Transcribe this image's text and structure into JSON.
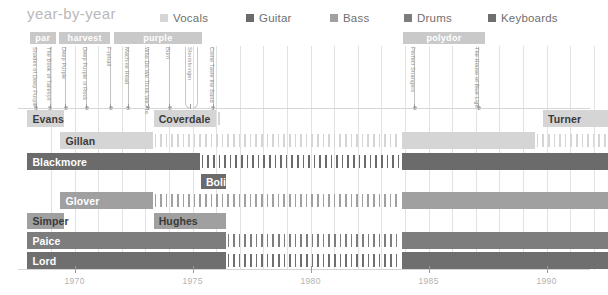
{
  "header": {
    "title": "year-by-year",
    "legend": [
      {
        "label": "Vocals",
        "color": "#d5d5d5",
        "x": 160
      },
      {
        "label": "Guitar",
        "color": "#6b6b6b",
        "x": 246
      },
      {
        "label": "Bass",
        "color": "#a0a0a0",
        "x": 330
      },
      {
        "label": "Drums",
        "color": "#7d7d7d",
        "x": 404
      },
      {
        "label": "Keyboards",
        "color": "#6f6f6f",
        "x": 488
      }
    ]
  },
  "colors": {
    "vocals": "#d5d5d5",
    "guitar": "#6b6b6b",
    "bass": "#a0a0a0",
    "drums": "#7d7d7d",
    "keyboards": "#6f6f6f",
    "grid": "#dfe3e2",
    "tick": "#9a9a9a",
    "labelbar": "#c9c9c9",
    "axis_text": "#b2b2b2",
    "album_text": "#8e8e8e",
    "title": "#b9b9b9"
  },
  "axis": {
    "x_start_year": 1967.6,
    "x_end_year": 1992.6,
    "px_per_year": 23.6,
    "x_origin_px": 18,
    "ticks": [
      {
        "label": "1970",
        "year": 1970
      },
      {
        "label": "1975",
        "year": 1975
      },
      {
        "label": "1980",
        "year": 1980
      },
      {
        "label": "1985",
        "year": 1985
      },
      {
        "label": "1990",
        "year": 1990
      }
    ],
    "gridlines_years": [
      1969,
      1970,
      1971,
      1972,
      1973,
      1974,
      1975,
      1976,
      1977,
      1978,
      1979,
      1980,
      1981,
      1982,
      1983,
      1984,
      1985,
      1986,
      1987,
      1988,
      1989,
      1990,
      1991,
      1992
    ]
  },
  "record_labels": [
    {
      "name": "par",
      "start": 1968.1,
      "end": 1969.2
    },
    {
      "name": "harvest",
      "start": 1969.35,
      "end": 1971.5
    },
    {
      "name": "purple",
      "start": 1971.65,
      "end": 1975.4
    },
    {
      "name": "polydor",
      "start": 1983.9,
      "end": 1987.4
    }
  ],
  "albums": [
    {
      "title": "Shades of Deep Purple",
      "year": 1968.35,
      "wide": false
    },
    {
      "title": "The Book of Taliesyn",
      "year": 1968.95,
      "wide": false
    },
    {
      "title": "Deep Purple",
      "year": 1969.6,
      "wide": false
    },
    {
      "title": "Deep Purple in Rock",
      "year": 1970.5,
      "wide": false
    },
    {
      "title": "Fireball",
      "year": 1971.5,
      "wide": false
    },
    {
      "title": "Machine Head",
      "year": 1972.25,
      "wide": false
    },
    {
      "title": "Who Do We Think We Are",
      "year": 1973.1,
      "wide": false
    },
    {
      "title": "Burn",
      "year": 1974.0,
      "wide": false
    },
    {
      "title": "Stormbringer",
      "year": 1974.9,
      "wide": true
    },
    {
      "title": "Come Taste the Band",
      "year": 1975.85,
      "wide": false
    },
    {
      "title": "Perfect Strangers",
      "year": 1984.4,
      "wide": false
    },
    {
      "title": "The House of Blue Light",
      "year": 1987.1,
      "wide": false
    }
  ],
  "members": [
    {
      "name": "Evans",
      "role": "Vocals",
      "color": "#d5d5d5",
      "dark_text": true,
      "row_y": 110,
      "row_h": 17,
      "segments": [
        {
          "start": 1968.0,
          "end": 1969.55
        }
      ],
      "hatches": []
    },
    {
      "name": "Coverdale",
      "role": "Vocals",
      "color": "#d5d5d5",
      "dark_text": true,
      "row_y": 110,
      "row_h": 17,
      "segments": [
        {
          "start": 1973.35,
          "end": 1976.0
        }
      ],
      "hatches": [
        {
          "start": 1976.0,
          "end": 1976.35
        }
      ]
    },
    {
      "name": "Turner",
      "role": "Vocals",
      "color": "#d5d5d5",
      "dark_text": true,
      "row_y": 110,
      "row_h": 17,
      "segments": [
        {
          "start": 1989.85,
          "end": 1992.6
        }
      ],
      "hatches": []
    },
    {
      "name": "Gillan",
      "role": "Vocals",
      "color": "#d5d5d5",
      "dark_text": true,
      "row_y": 132,
      "row_h": 17,
      "segments": [
        {
          "start": 1969.4,
          "end": 1973.3
        },
        {
          "start": 1983.85,
          "end": 1989.5
        }
      ],
      "hatches": [
        {
          "start": 1973.3,
          "end": 1983.85
        },
        {
          "start": 1989.5,
          "end": 1992.6
        }
      ]
    },
    {
      "name": "Blackmore",
      "role": "Guitar",
      "color": "#6b6b6b",
      "dark_text": false,
      "row_y": 153,
      "row_h": 17,
      "segments": [
        {
          "start": 1968.0,
          "end": 1975.3
        },
        {
          "start": 1983.85,
          "end": 1992.6
        }
      ],
      "hatches": [
        {
          "start": 1975.3,
          "end": 1983.85
        }
      ]
    },
    {
      "name": "Bolin",
      "role": "Guitar",
      "color": "#6b6b6b",
      "dark_text": false,
      "row_y": 174,
      "row_h": 15,
      "segments": [
        {
          "start": 1975.35,
          "end": 1976.4
        }
      ],
      "hatches": []
    },
    {
      "name": "Glover",
      "role": "Bass",
      "color": "#a0a0a0",
      "dark_text": false,
      "row_y": 192,
      "row_h": 17,
      "segments": [
        {
          "start": 1969.4,
          "end": 1973.3
        },
        {
          "start": 1983.85,
          "end": 1992.6
        }
      ],
      "hatches": [
        {
          "start": 1973.3,
          "end": 1983.85
        }
      ]
    },
    {
      "name": "Simper",
      "role": "Bass",
      "color": "#a0a0a0",
      "dark_text": true,
      "row_y": 213,
      "row_h": 16,
      "segments": [
        {
          "start": 1968.0,
          "end": 1969.55
        }
      ],
      "hatches": []
    },
    {
      "name": "Hughes",
      "role": "Bass",
      "color": "#a0a0a0",
      "dark_text": true,
      "row_y": 213,
      "row_h": 16,
      "segments": [
        {
          "start": 1973.35,
          "end": 1976.4
        }
      ],
      "hatches": []
    },
    {
      "name": "Paice",
      "role": "Drums",
      "color": "#7d7d7d",
      "dark_text": false,
      "row_y": 232,
      "row_h": 17,
      "segments": [
        {
          "start": 1968.0,
          "end": 1976.4
        },
        {
          "start": 1983.85,
          "end": 1992.6
        }
      ],
      "hatches": [
        {
          "start": 1976.4,
          "end": 1983.85
        }
      ]
    },
    {
      "name": "Lord",
      "role": "Keyboards",
      "color": "#6f6f6f",
      "dark_text": false,
      "row_y": 252,
      "row_h": 17,
      "segments": [
        {
          "start": 1968.0,
          "end": 1976.4
        },
        {
          "start": 1983.85,
          "end": 1992.6
        }
      ],
      "hatches": [
        {
          "start": 1976.4,
          "end": 1983.85
        }
      ]
    }
  ],
  "chart_data": {
    "type": "table",
    "title": "year-by-year",
    "xlabel": "",
    "ylabel": "",
    "xlim": [
      1967.6,
      1992.6
    ],
    "grid": true,
    "legend_position": "top",
    "legend": [
      "Vocals",
      "Guitar",
      "Bass",
      "Drums",
      "Keyboards"
    ],
    "tick_labels": [
      "1970",
      "1975",
      "1980",
      "1985",
      "1990"
    ],
    "series": [
      {
        "name": "Evans",
        "role": "Vocals",
        "active": [
          [
            1968.0,
            1969.55
          ]
        ]
      },
      {
        "name": "Coverdale",
        "role": "Vocals",
        "active": [
          [
            1973.35,
            1976.0
          ]
        ]
      },
      {
        "name": "Turner",
        "role": "Vocals",
        "active": [
          [
            1989.85,
            1992.6
          ]
        ]
      },
      {
        "name": "Gillan",
        "role": "Vocals",
        "active": [
          [
            1969.4,
            1973.3
          ],
          [
            1983.85,
            1989.5
          ]
        ]
      },
      {
        "name": "Blackmore",
        "role": "Guitar",
        "active": [
          [
            1968.0,
            1975.3
          ],
          [
            1983.85,
            1992.6
          ]
        ]
      },
      {
        "name": "Bolin",
        "role": "Guitar",
        "active": [
          [
            1975.35,
            1976.4
          ]
        ]
      },
      {
        "name": "Glover",
        "role": "Bass",
        "active": [
          [
            1969.4,
            1973.3
          ],
          [
            1983.85,
            1992.6
          ]
        ]
      },
      {
        "name": "Simper",
        "role": "Bass",
        "active": [
          [
            1968.0,
            1969.55
          ]
        ]
      },
      {
        "name": "Hughes",
        "role": "Bass",
        "active": [
          [
            1973.35,
            1976.4
          ]
        ]
      },
      {
        "name": "Paice",
        "role": "Drums",
        "active": [
          [
            1968.0,
            1976.4
          ],
          [
            1983.85,
            1992.6
          ]
        ]
      },
      {
        "name": "Lord",
        "role": "Keyboards",
        "active": [
          [
            1968.0,
            1976.4
          ],
          [
            1983.85,
            1992.6
          ]
        ]
      }
    ],
    "albums": [
      "Shades of Deep Purple",
      "The Book of Taliesyn",
      "Deep Purple",
      "Deep Purple in Rock",
      "Fireball",
      "Machine Head",
      "Who Do We Think We Are",
      "Burn",
      "Stormbringer",
      "Come Taste the Band",
      "Perfect Strangers",
      "The House of Blue Light"
    ],
    "record_labels": [
      "par",
      "harvest",
      "purple",
      "polydor"
    ]
  }
}
